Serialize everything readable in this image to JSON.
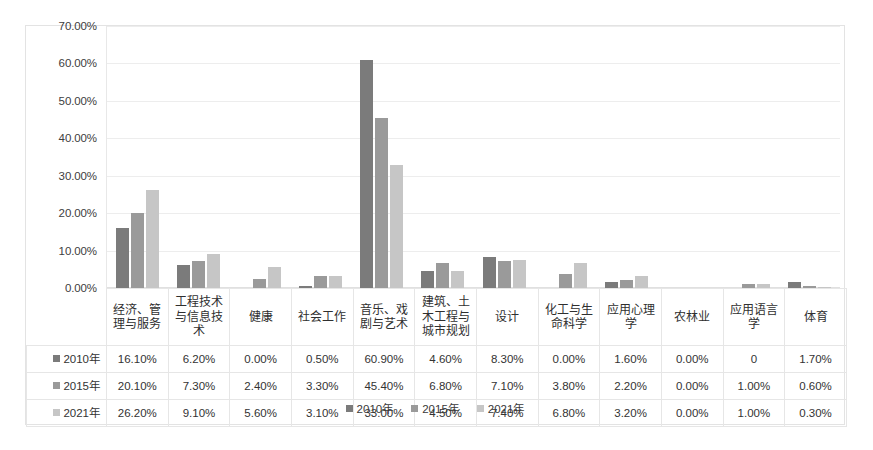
{
  "chart_data": {
    "type": "bar",
    "title": "",
    "subtitle": "",
    "xlabel": "",
    "ylabel": "",
    "ylim": [
      0,
      70
    ],
    "grid": true,
    "legend_position": "bottom",
    "y_ticks": [
      "0.00%",
      "10.00%",
      "20.00%",
      "30.00%",
      "40.00%",
      "50.00%",
      "60.00%",
      "70.00%"
    ],
    "y_tick_values": [
      0,
      10,
      20,
      30,
      40,
      50,
      60,
      70
    ],
    "categories": [
      "经济、管理与服务",
      "工程技术与信息技术",
      "健康",
      "社会工作",
      "音乐、戏剧与艺术",
      "建筑、土木工程与城市规划",
      "设计",
      "化工与生命科学",
      "应用心理学",
      "农林业",
      "应用语言学",
      "体育"
    ],
    "series": [
      {
        "name": "2010年",
        "color": "#7b7b7b",
        "values": [
          16.1,
          6.2,
          0.0,
          0.5,
          60.9,
          4.6,
          8.3,
          0.0,
          1.6,
          0.0,
          0.0,
          1.7
        ],
        "labels": [
          "16.10%",
          "6.20%",
          "0.00%",
          "0.50%",
          "60.90%",
          "4.60%",
          "8.30%",
          "0.00%",
          "1.60%",
          "0.00%",
          "0",
          "1.70%"
        ]
      },
      {
        "name": "2015年",
        "color": "#9a9a9a",
        "values": [
          20.1,
          7.3,
          2.4,
          3.3,
          45.4,
          6.8,
          7.1,
          3.8,
          2.2,
          0.0,
          1.0,
          0.6
        ],
        "labels": [
          "20.10%",
          "7.30%",
          "2.40%",
          "3.30%",
          "45.40%",
          "6.80%",
          "7.10%",
          "3.80%",
          "2.20%",
          "0.00%",
          "1.00%",
          "0.60%"
        ]
      },
      {
        "name": "2021年",
        "color": "#c6c6c6",
        "values": [
          26.2,
          9.1,
          5.6,
          3.1,
          33.0,
          4.5,
          7.4,
          6.8,
          3.2,
          0.0,
          1.0,
          0.3
        ],
        "labels": [
          "26.20%",
          "9.10%",
          "5.60%",
          "3.10%",
          "33.00%",
          "4.50%",
          "7.40%",
          "6.80%",
          "3.20%",
          "0.00%",
          "1.00%",
          "0.30%"
        ]
      }
    ]
  },
  "legend": {
    "items": [
      {
        "label": "2010年",
        "color": "#7b7b7b"
      },
      {
        "label": "2015年",
        "color": "#9a9a9a"
      },
      {
        "label": "2021年",
        "color": "#c6c6c6"
      }
    ]
  },
  "colors": {
    "series_2010": "#7b7b7b",
    "series_2015": "#9a9a9a",
    "series_2021": "#c6c6c6",
    "gridline": "#ededed",
    "border": "#e3e3e3",
    "text": "#333333"
  }
}
